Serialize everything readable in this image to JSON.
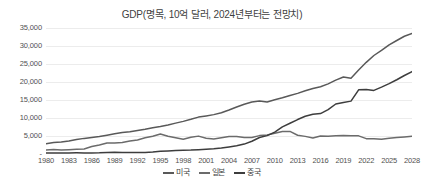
{
  "chart_data": {
    "type": "line",
    "title": "GDP(명목, 10억 달러, 2024년부터는 전망치)",
    "xlabel": "",
    "ylabel": "",
    "ylim": [
      0,
      35000
    ],
    "ytick_labels": [
      "35,000",
      "30,000",
      "25,000",
      "20,000",
      "15,000",
      "10,000",
      "5,000",
      "-"
    ],
    "ytick_values": [
      35000,
      30000,
      25000,
      20000,
      15000,
      10000,
      5000,
      0
    ],
    "grid": true,
    "legend_position": "bottom",
    "xlim": [
      1980,
      2028
    ],
    "x": [
      1980,
      1981,
      1982,
      1983,
      1984,
      1985,
      1986,
      1987,
      1988,
      1989,
      1990,
      1991,
      1992,
      1993,
      1994,
      1995,
      1996,
      1997,
      1998,
      1999,
      2000,
      2001,
      2002,
      2003,
      2004,
      2005,
      2006,
      2007,
      2008,
      2009,
      2010,
      2011,
      2012,
      2013,
      2014,
      2015,
      2016,
      2017,
      2018,
      2019,
      2020,
      2021,
      2022,
      2023,
      2024,
      2025,
      2026,
      2027,
      2028
    ],
    "xtick_labels": [
      "1980",
      "1983",
      "1986",
      "1989",
      "1992",
      "1995",
      "1998",
      "2001",
      "2004",
      "2007",
      "2010",
      "2013",
      "2016",
      "2019",
      "2022",
      "2025",
      "2028"
    ],
    "xtick_values": [
      1980,
      1983,
      1986,
      1989,
      1992,
      1995,
      1998,
      2001,
      2004,
      2007,
      2010,
      2013,
      2016,
      2019,
      2022,
      2025,
      2028
    ],
    "series": [
      {
        "name": "미국",
        "color": "#595959",
        "values": [
          2857,
          3207,
          3344,
          3634,
          4038,
          4339,
          4580,
          4855,
          5236,
          5642,
          5963,
          6158,
          6520,
          6859,
          7287,
          7640,
          8073,
          8578,
          9063,
          9631,
          10251,
          10582,
          10936,
          11458,
          12214,
          13037,
          13815,
          14452,
          14713,
          14449,
          15049,
          15600,
          16254,
          16844,
          17551,
          18206,
          18695,
          19479,
          20527,
          21381,
          21060,
          23315,
          25463,
          27361,
          28783,
          30337,
          31530,
          32700,
          33500
        ]
      },
      {
        "name": "일본",
        "color": "#6b6b6b",
        "values": [
          1128,
          1246,
          1135,
          1214,
          1295,
          1399,
          2060,
          2504,
          3073,
          3079,
          3186,
          3584,
          3915,
          4492,
          4908,
          5545,
          4923,
          4492,
          4098,
          4636,
          4968,
          4375,
          4182,
          4519,
          4893,
          4831,
          4601,
          4579,
          5106,
          5289,
          5759,
          6233,
          6272,
          5212,
          4897,
          4445,
          5004,
          4931,
          5041,
          5118,
          5055,
          5035,
          4257,
          4213,
          4110,
          4390,
          4560,
          4720,
          4900
        ]
      },
      {
        "name": "중국",
        "color": "#3d3d3d",
        "values": [
          303,
          289,
          284,
          305,
          314,
          310,
          301,
          328,
          413,
          461,
          398,
          383,
          427,
          445,
          564,
          735,
          863,
          962,
          1029,
          1094,
          1211,
          1339,
          1471,
          1660,
          1955,
          2286,
          2752,
          3550,
          4594,
          5102,
          6087,
          7552,
          8532,
          9570,
          10476,
          11062,
          11233,
          12310,
          13895,
          14280,
          14688,
          17820,
          17882,
          17662,
          18560,
          19530,
          20630,
          21800,
          22900
        ]
      }
    ]
  },
  "legend": {
    "items": [
      {
        "label": "미국"
      },
      {
        "label": "일본"
      },
      {
        "label": "중국"
      }
    ]
  }
}
